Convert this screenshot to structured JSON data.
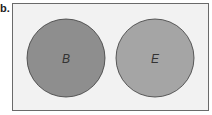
{
  "figure": {
    "label": "b.",
    "sets": [
      {
        "name": "B",
        "color": "#8e8e8e"
      },
      {
        "name": "E",
        "color": "#a5a5a5"
      }
    ],
    "background": "#f2f2f2",
    "relationship": "disjoint"
  }
}
